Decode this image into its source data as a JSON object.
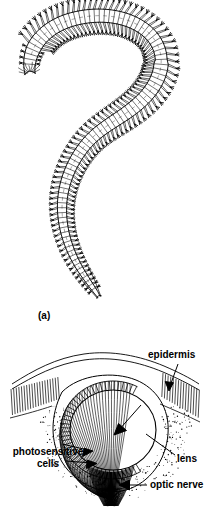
{
  "figure": {
    "background_color": "#ffffff",
    "ink_color": "#000000",
    "width": 211,
    "height": 508
  },
  "panels": [
    {
      "id": "a",
      "caption": "(a)",
      "subject": "whole polychaete worm",
      "description": "Dorsal view of a segmented polychaete annelid worm curved in a question-mark shape, with a head bearing antennae and palps, numerous body segments each bearing a pair of parapodia with chaetae, and a tail with two anal cirri.",
      "segment_count": 96
    },
    {
      "id": "d",
      "caption": "(d)",
      "subject": "cross-section of the worm eye",
      "description": "Sectional diagram of a cephalic eye showing a large spherical lens enclosed by a cup of photosensitive cells, covered by epidermis, with optic nerve fibres leaving below."
    }
  ],
  "annotations": [
    {
      "name": "epidermis",
      "label": "epidermis",
      "pointer": "arrow pointing down-left to the epidermal layer",
      "position": "top-right"
    },
    {
      "name": "lens",
      "label": "lens",
      "pointer": "leader line running down-left to the lens",
      "position": "mid-right"
    },
    {
      "name": "photosensitive-cells",
      "label": "photosensitive cells",
      "label_line_1": "photosensitive",
      "label_line_2": "cells",
      "pointer": "two arrows pointing right to the retinal cell layer",
      "position": "mid-left"
    },
    {
      "name": "optic-nerve",
      "label": "optic nerve",
      "pointer": "arrow pointing left to the nerve fibre bundle",
      "position": "bottom-right"
    }
  ]
}
